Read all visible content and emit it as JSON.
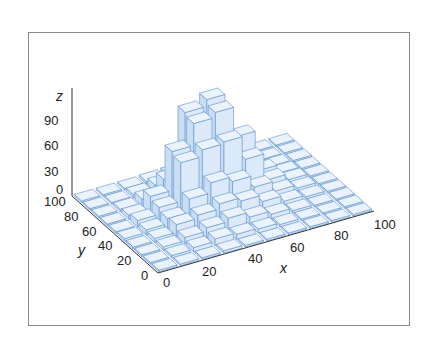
{
  "chart_data": {
    "type": "bar3d",
    "title": "",
    "xlabel": "x",
    "ylabel": "y",
    "zlabel": "z",
    "x_ticks": [
      "0",
      "20",
      "40",
      "60",
      "80",
      "100"
    ],
    "y_ticks": [
      "0",
      "20",
      "40",
      "60",
      "80",
      "100"
    ],
    "z_ticks": [
      "0",
      "30",
      "60",
      "90"
    ],
    "xlim": [
      0,
      100
    ],
    "ylim": [
      0,
      100
    ],
    "zlim": [
      0,
      100
    ],
    "bin_width": 10,
    "x_bins": [
      0,
      10,
      20,
      30,
      40,
      50,
      60,
      70,
      80,
      90
    ],
    "y_bins": [
      0,
      10,
      20,
      30,
      40,
      50,
      60,
      70,
      80,
      90
    ],
    "heights": [
      [
        2,
        2,
        2,
        3,
        2,
        2,
        2,
        2,
        2,
        2
      ],
      [
        2,
        3,
        5,
        8,
        6,
        5,
        3,
        2,
        2,
        2
      ],
      [
        2,
        4,
        8,
        12,
        16,
        10,
        6,
        3,
        2,
        2
      ],
      [
        2,
        5,
        14,
        18,
        24,
        20,
        12,
        5,
        3,
        2
      ],
      [
        3,
        6,
        12,
        28,
        40,
        34,
        20,
        8,
        4,
        2
      ],
      [
        2,
        8,
        16,
        62,
        70,
        72,
        44,
        12,
        5,
        2
      ],
      [
        2,
        5,
        20,
        66,
        92,
        98,
        62,
        14,
        4,
        2
      ],
      [
        2,
        3,
        8,
        24,
        96,
        104,
        30,
        8,
        3,
        2
      ],
      [
        2,
        2,
        4,
        8,
        14,
        16,
        8,
        4,
        2,
        2
      ],
      [
        2,
        2,
        2,
        3,
        4,
        3,
        3,
        2,
        2,
        2
      ]
    ],
    "heights_note": "rows indexed by y bin (0..90), columns by x bin (0..90); values estimated from image",
    "grid": false,
    "colors": {
      "bar_face": "#dbe9f8",
      "bar_top": "#eaf3fc",
      "bar_side": "#c9ddf3",
      "bar_edge": "#5b8fd0",
      "axis": "#333333",
      "frame": "#8a8a8a"
    }
  }
}
